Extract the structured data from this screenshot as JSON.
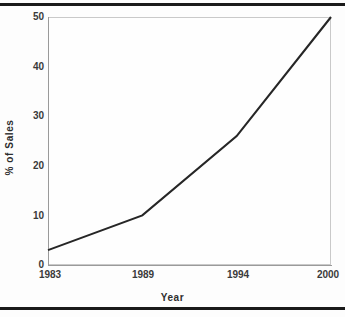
{
  "figure": {
    "page_rule_color": "#1a1a1a",
    "axis_color": "#9a9a9a",
    "line_color": "#262626",
    "background_color": "#fdfdfd",
    "plot_background_color": "#fefefe"
  },
  "chart_data": {
    "type": "line",
    "title": "",
    "xlabel": "Year",
    "ylabel": "% of Sales",
    "categories": [
      "1983",
      "1989",
      "1994",
      "2000"
    ],
    "x": [
      1983,
      1989,
      1994,
      2000
    ],
    "values": [
      3,
      10,
      26,
      50
    ],
    "series": [
      {
        "name": "% of Sales",
        "values": [
          3,
          10,
          26,
          50
        ]
      }
    ],
    "xtick_labels": [
      "1983",
      "1989",
      "1994",
      "2000"
    ],
    "ytick_labels": [
      "0",
      "10",
      "20",
      "30",
      "40",
      "50"
    ],
    "ytick_values": [
      0,
      10,
      20,
      30,
      40,
      50
    ],
    "ylim": [
      0,
      50
    ],
    "grid": false,
    "legend": false,
    "legend_position": "none",
    "annotations": []
  }
}
